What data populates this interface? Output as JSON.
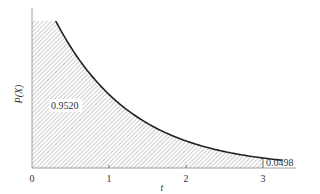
{
  "chart_data": {
    "type": "area",
    "title": "",
    "function": "f(t) = e^(-t)",
    "xlabel": "t",
    "ylabel": "P(X)",
    "x_ticks": [
      "0",
      "1",
      "2",
      "3"
    ],
    "xlim": [
      0,
      3.25
    ],
    "ylim": [
      0,
      0.74
    ],
    "grid": false,
    "legend": null,
    "shaded_region": {
      "from": 0,
      "to": 3,
      "pattern": "diagonal-hatch"
    },
    "annotations": [
      {
        "text": "0.9520",
        "meaning": "shaded area from t=0 to t=3",
        "x": 0.35,
        "y": 0.22
      },
      {
        "text": "0.0498",
        "meaning": "remaining tail area beyond t=3",
        "x": 3.05,
        "y": 0.03
      }
    ],
    "x": [
      0.3,
      0.5,
      1.0,
      1.5,
      2.0,
      2.5,
      3.0,
      3.25
    ],
    "values": [
      0.741,
      0.607,
      0.368,
      0.223,
      0.135,
      0.082,
      0.05,
      0.039
    ],
    "curve_color": "#222222",
    "hatch_color": "#9a9a9a"
  },
  "labels": {
    "ylabel": "P(X)",
    "xlabel": "t",
    "area_main": "0.9520",
    "area_tail": "0.0498",
    "tick0": "0",
    "tick1": "1",
    "tick2": "2",
    "tick3": "3"
  }
}
